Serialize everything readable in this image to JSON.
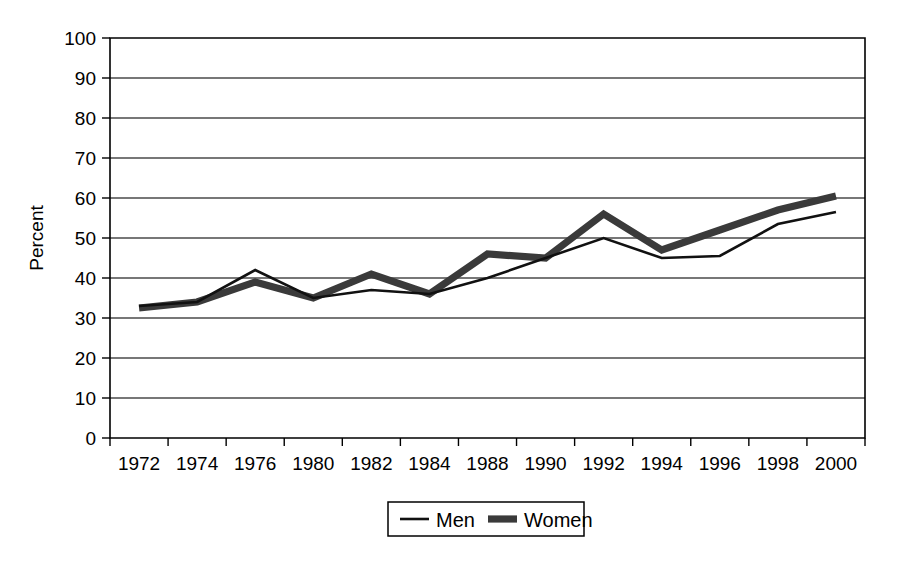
{
  "chart_data": {
    "type": "line",
    "title": "",
    "xlabel": "",
    "ylabel": "Percent",
    "ylim": [
      0,
      100
    ],
    "ytick_step": 10,
    "yticks": [
      "0",
      "10",
      "20",
      "30",
      "40",
      "50",
      "60",
      "70",
      "80",
      "90",
      "100"
    ],
    "grid": "horizontal",
    "legend_position": "bottom-center",
    "categories": [
      "1972",
      "1974",
      "1976",
      "1980",
      "1982",
      "1984",
      "1988",
      "1990",
      "1992",
      "1994",
      "1996",
      "1998",
      "2000"
    ],
    "series": [
      {
        "name": "Men",
        "style": "thin-solid",
        "color": "#111111",
        "values": [
          33,
          34,
          42,
          35,
          37,
          36,
          40,
          45,
          50,
          45,
          45.5,
          53.5,
          56.5
        ]
      },
      {
        "name": "Women",
        "style": "thick-solid",
        "color": "#3a3a3a",
        "values": [
          32.5,
          34,
          39,
          35,
          41,
          36,
          46,
          45,
          56,
          47,
          52,
          57,
          60.5
        ]
      }
    ]
  },
  "legend": {
    "entries": [
      {
        "label": "Men"
      },
      {
        "label": "Women"
      }
    ]
  },
  "axes": {
    "y_title": "Percent"
  }
}
